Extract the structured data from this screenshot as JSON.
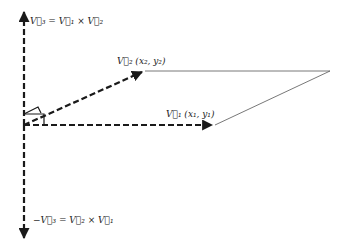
{
  "diagram": {
    "type": "vector cross product",
    "labels": {
      "v3": "V⃗₃ = V⃗₁ × V⃗₂",
      "v2": "V⃗₂ (x₂, y₂)",
      "v1": "V⃗₁ (x₁, y₁)",
      "neg_v3": "−V⃗₃ = V⃗₂ × V⃗₁"
    },
    "colors": {
      "stroke": "#1a1a1a",
      "thin_line": "#555555",
      "background": "#ffffff"
    },
    "points": {
      "origin": [
        24,
        125
      ],
      "v3_tip": [
        24,
        8
      ],
      "neg_v3_tip": [
        24,
        242
      ],
      "v2_tip": [
        145,
        71
      ],
      "v1_tip": [
        215,
        125
      ],
      "parallelogram_far": [
        330,
        71
      ]
    }
  }
}
